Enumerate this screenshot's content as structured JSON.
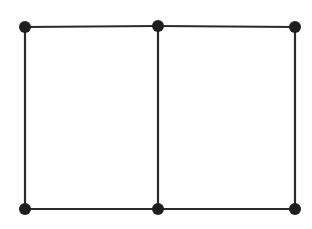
{
  "diagram": {
    "type": "graph",
    "colors": {
      "edge": "#2a2a2a",
      "node": "#1f1f1f",
      "background": "#ffffff"
    },
    "node_radius": 6,
    "nodes": [
      {
        "id": "n1",
        "x": 25,
        "y": 27
      },
      {
        "id": "n2",
        "x": 158,
        "y": 26
      },
      {
        "id": "n3",
        "x": 295,
        "y": 27
      },
      {
        "id": "n4",
        "x": 25,
        "y": 209
      },
      {
        "id": "n5",
        "x": 158,
        "y": 209
      },
      {
        "id": "n6",
        "x": 295,
        "y": 209
      }
    ],
    "edges": [
      [
        "n1",
        "n2"
      ],
      [
        "n2",
        "n3"
      ],
      [
        "n4",
        "n5"
      ],
      [
        "n5",
        "n6"
      ],
      [
        "n1",
        "n4"
      ],
      [
        "n2",
        "n5"
      ],
      [
        "n3",
        "n6"
      ]
    ]
  }
}
